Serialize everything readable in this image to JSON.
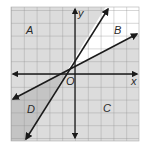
{
  "figure": {
    "type": "coordinate-plane-inequality-regions",
    "axes": {
      "x_label": "x",
      "y_label": "y",
      "origin_label": "O"
    },
    "regions": [
      {
        "label": "A",
        "position": "upper-left",
        "shaded": true
      },
      {
        "label": "B",
        "position": "upper-right, between lines",
        "shaded": false
      },
      {
        "label": "C",
        "position": "lower-right",
        "shaded": true
      },
      {
        "label": "D",
        "position": "lower-left, between lines",
        "shaded": true,
        "darker": true
      }
    ],
    "lines": [
      {
        "name": "steep-line",
        "description": "steeper line through near origin"
      },
      {
        "name": "shallow-line",
        "description": "less steep line through near origin"
      }
    ],
    "colors": {
      "background": "#ffffff",
      "grid_fill": "#dcdcdc",
      "grid_lines": "#8f8f8f",
      "region_b": "#ffffff",
      "region_d": "#c4c4c4",
      "lines": "#1a1a1a"
    }
  },
  "labels": {
    "A": "A",
    "B": "B",
    "C": "C",
    "D": "D",
    "x": "x",
    "y": "y",
    "O": "O"
  }
}
